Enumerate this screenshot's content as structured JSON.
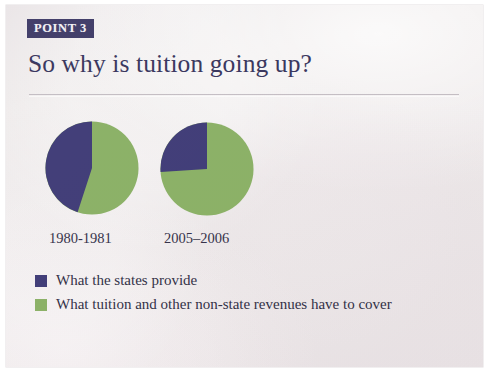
{
  "page": {
    "badge_label": "POINT 3",
    "headline": "So why is tuition going up?"
  },
  "colors": {
    "navy": "#3a3673",
    "green": "#87ae61",
    "badge_bg": "#3a3663",
    "headline_text": "#322f58",
    "paper": "#ece7e8",
    "rule": "#b9b2b8"
  },
  "chart_data": {
    "type": "pie",
    "title": "So why is tuition going up?",
    "legend_position": "bottom-left",
    "legend": [
      {
        "label": "What the states provide",
        "color": "#3a3673",
        "swatch_name": "navy"
      },
      {
        "label": "What tuition and other non-state revenues have to cover",
        "color": "#87ae61",
        "swatch_name": "green"
      }
    ],
    "charts": [
      {
        "label": "1980-1981",
        "categories": [
          "What the states provide",
          "What tuition and other non-state revenues have to cover"
        ],
        "values": [
          45,
          55
        ],
        "unit": "percent"
      },
      {
        "label": "2005–2006",
        "categories": [
          "What the states provide",
          "What tuition and other non-state revenues have to cover"
        ],
        "values": [
          26,
          74
        ],
        "unit": "percent"
      }
    ]
  }
}
